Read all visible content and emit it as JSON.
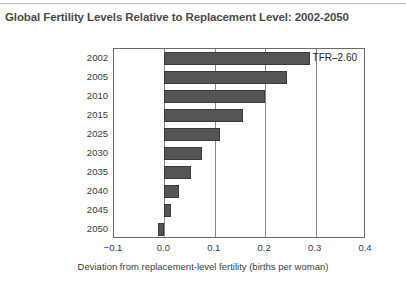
{
  "chart_data": {
    "type": "bar",
    "orientation": "horizontal",
    "title": "Global Fertility Levels Relative to Replacement Level: 2002-2050",
    "xlabel": "Deviation from replacement-level fertility (births per woman)",
    "ylabel": "",
    "categories": [
      "2002",
      "2005",
      "2010",
      "2015",
      "2025",
      "2030",
      "2035",
      "2040",
      "2045",
      "2050"
    ],
    "values": [
      0.288,
      0.244,
      0.2,
      0.155,
      0.11,
      0.075,
      0.052,
      0.028,
      0.013,
      -0.013
    ],
    "xlim": [
      -0.1,
      0.4
    ],
    "xticks": [
      "-0.1",
      "0.0",
      "0.1",
      "0.2",
      "0.3",
      "0.4"
    ],
    "xtick_values": [
      -0.1,
      0.0,
      0.1,
      0.2,
      0.3,
      0.4
    ],
    "grid": true,
    "legend": "none",
    "bar_color": "#555555",
    "annotations": [
      {
        "text": "TFR–2.60",
        "x": 0.29,
        "category": "2002"
      }
    ]
  }
}
